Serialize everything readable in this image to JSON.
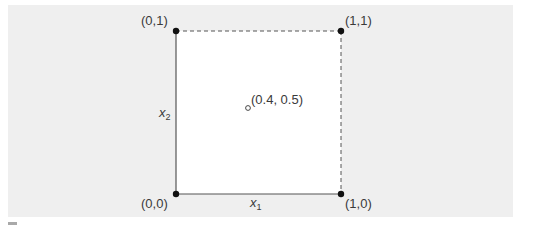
{
  "figure": {
    "background_color": "#efefef",
    "square_fill": "#ffffff",
    "line_color": "#555555",
    "point_color": "#111111",
    "text_color": "#3a3a3a",
    "vertices": [
      {
        "id": "v00",
        "label": "(0,0)",
        "filled": true
      },
      {
        "id": "v10",
        "label": "(1,0)",
        "filled": true
      },
      {
        "id": "v01",
        "label": "(0,1)",
        "filled": true
      },
      {
        "id": "v11",
        "label": "(1,1)",
        "filled": true
      }
    ],
    "interior_point": {
      "label": "(0.4, 0.5)",
      "filled": false,
      "x": 0.4,
      "y": 0.5
    },
    "edges": [
      {
        "from": "(0,0)",
        "to": "(1,0)",
        "style": "solid"
      },
      {
        "from": "(0,0)",
        "to": "(0,1)",
        "style": "solid"
      },
      {
        "from": "(0,1)",
        "to": "(1,1)",
        "style": "dashed"
      },
      {
        "from": "(1,0)",
        "to": "(1,1)",
        "style": "dashed"
      }
    ],
    "axis_labels": {
      "x": {
        "base": "x",
        "sub": "1"
      },
      "y": {
        "base": "x",
        "sub": "2"
      }
    }
  }
}
